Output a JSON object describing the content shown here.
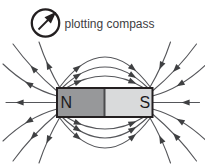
{
  "legend": {
    "icon": "plotting-compass-icon",
    "label": "plotting compass"
  },
  "magnet": {
    "north_label": "N",
    "south_label": "S"
  },
  "colors": {
    "background": "#ffffff",
    "field_line": "#55565a",
    "arrow": "#3f4042",
    "outline": "#231f20",
    "magnet_north_fill": "#97989a",
    "magnet_south_fill": "#d9dadb",
    "magnet_divider": "#4a4b4d",
    "label_text": "#1b1b1d",
    "legend_text": "#414042"
  }
}
